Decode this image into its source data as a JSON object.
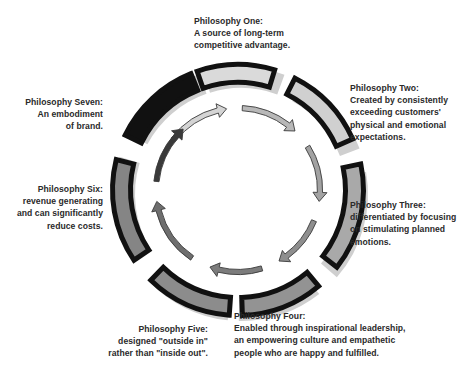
{
  "diagram": {
    "type": "cycle",
    "center": {
      "x": 238,
      "y": 190
    },
    "ring": {
      "outer_radius": 128,
      "inner_radius": 105
    },
    "arrow_radius": 82,
    "colors": {
      "stroke": "#111111",
      "shadow": "#cfcfcf"
    },
    "segments": [
      {
        "id": "one",
        "start": -19,
        "end": 17,
        "fill": "#dadada"
      },
      {
        "id": "two",
        "start": 27,
        "end": 66,
        "fill": "#d0d0d0"
      },
      {
        "id": "three",
        "start": 78,
        "end": 128,
        "fill": "#a9a9a9"
      },
      {
        "id": "four",
        "start": 140,
        "end": 178,
        "fill": "#939393"
      },
      {
        "id": "five",
        "start": 184,
        "end": 224,
        "fill": "#8c8c8c"
      },
      {
        "id": "six",
        "start": 236,
        "end": 284,
        "fill": "#858585"
      },
      {
        "id": "seven",
        "start": 296,
        "end": 338,
        "fill": "#111111"
      }
    ],
    "arrows": [
      {
        "start": -52,
        "end": -8,
        "fill": "#d4d4d4"
      },
      {
        "start": 3,
        "end": 44,
        "fill": "#b8b8b8"
      },
      {
        "start": 58,
        "end": 98,
        "fill": "#a2a2a2"
      },
      {
        "start": 112,
        "end": 150,
        "fill": "#8e8e8e"
      },
      {
        "start": 163,
        "end": 200,
        "fill": "#7c7c7c"
      },
      {
        "start": 214,
        "end": 262,
        "fill": "#6e6e6e"
      },
      {
        "start": 276,
        "end": 318,
        "fill": "#3a3a3a"
      }
    ]
  },
  "philosophies": [
    {
      "title": "Philosophy One:",
      "lines": [
        "A source of long-term",
        "competitive advantage."
      ]
    },
    {
      "title": "Philosophy Two:",
      "lines": [
        "Created by consistently",
        "exceeding customers'",
        "physical and emotional",
        "expectations."
      ]
    },
    {
      "title": "Philosophy Three:",
      "lines": [
        "differentiated by focusing",
        "on stimulating planned",
        "emotions."
      ]
    },
    {
      "title": "Philosophy Four:",
      "lines": [
        "Enabled through inspirational leadership,",
        "an empowering culture and empathetic",
        "people who are happy and fulfilled."
      ]
    },
    {
      "title": "Philosophy Five:",
      "lines": [
        "designed \"outside in\"",
        "rather than \"inside out\"."
      ]
    },
    {
      "title": "Philosophy Six:",
      "lines": [
        "revenue generating",
        "and can significantly",
        "reduce costs."
      ]
    },
    {
      "title": "Philosophy Seven:",
      "lines": [
        "An embodiment",
        "of brand."
      ]
    }
  ]
}
